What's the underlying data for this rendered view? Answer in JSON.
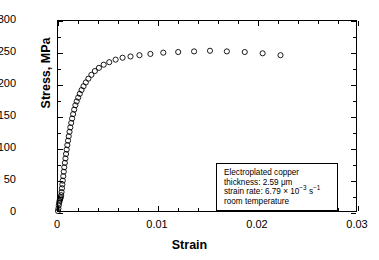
{
  "chart_data": {
    "type": "scatter",
    "title": "",
    "xlabel": "Strain",
    "ylabel": "Stress, MPa",
    "xlim": [
      0,
      0.03
    ],
    "ylim": [
      0,
      300
    ],
    "xticks": [
      0,
      0.01,
      0.02,
      0.03
    ],
    "xticklabels": [
      "0",
      "0.01",
      "0.02",
      "0.03"
    ],
    "yticks": [
      0,
      50,
      100,
      150,
      200,
      250,
      300
    ],
    "yticklabels": [
      "0",
      "50",
      "100",
      "150",
      "200",
      "250",
      "300"
    ],
    "x_minor_interval": 0.002,
    "y_minor_interval": 25,
    "grid": false,
    "legend": "none",
    "marker": "open-circle",
    "marker_color": "#000000",
    "series": [
      {
        "name": "Electroplated copper stress-strain",
        "points": [
          [
            0.0,
            0
          ],
          [
            4e-05,
            4
          ],
          [
            8e-05,
            9
          ],
          [
            0.00012,
            13
          ],
          [
            0.00016,
            16
          ],
          [
            0.0002,
            18
          ],
          [
            0.00024,
            20
          ],
          [
            0.00028,
            22
          ],
          [
            0.00032,
            25
          ],
          [
            0.00036,
            30
          ],
          [
            0.0004,
            36
          ],
          [
            0.00044,
            42
          ],
          [
            0.00048,
            48
          ],
          [
            0.00053,
            55
          ],
          [
            0.00058,
            62
          ],
          [
            0.00063,
            69
          ],
          [
            0.00069,
            76
          ],
          [
            0.00075,
            83
          ],
          [
            0.00081,
            90
          ],
          [
            0.00087,
            97
          ],
          [
            0.00094,
            104
          ],
          [
            0.00101,
            111
          ],
          [
            0.00108,
            118
          ],
          [
            0.00116,
            125
          ],
          [
            0.00124,
            132
          ],
          [
            0.00133,
            139
          ],
          [
            0.00142,
            146
          ],
          [
            0.00152,
            153
          ],
          [
            0.00163,
            160
          ],
          [
            0.00175,
            167
          ],
          [
            0.00188,
            173
          ],
          [
            0.00203,
            179
          ],
          [
            0.00219,
            185
          ],
          [
            0.00237,
            191
          ],
          [
            0.00257,
            197
          ],
          [
            0.0028,
            203
          ],
          [
            0.00306,
            209
          ],
          [
            0.00336,
            215
          ],
          [
            0.00371,
            221
          ],
          [
            0.00412,
            226
          ],
          [
            0.0046,
            231
          ],
          [
            0.00516,
            235
          ],
          [
            0.0058,
            239
          ],
          [
            0.0065,
            242
          ],
          [
            0.0073,
            244
          ],
          [
            0.0082,
            246
          ],
          [
            0.0093,
            248
          ],
          [
            0.0106,
            250
          ],
          [
            0.0121,
            251
          ],
          [
            0.0137,
            252
          ],
          [
            0.0153,
            253
          ],
          [
            0.017,
            252
          ],
          [
            0.0188,
            251
          ],
          [
            0.0206,
            249
          ],
          [
            0.0224,
            246
          ]
        ]
      }
    ],
    "annotation": {
      "line1": "Electroplated copper",
      "line2": "thickness:  2.59 μm",
      "line3_prefix": "strain rate:  6.79 × 10",
      "line3_exp": "−3",
      "line3_unit": " s",
      "line3_unit_exp": "−1",
      "line4": "room temperature"
    }
  }
}
